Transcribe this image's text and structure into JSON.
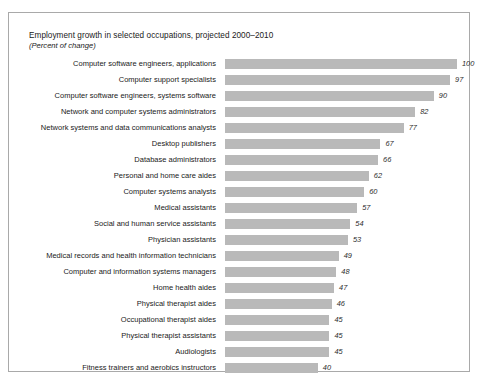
{
  "chart_data": {
    "type": "bar",
    "orientation": "horizontal",
    "title": "Employment growth in selected occupations, projected 2000–2010",
    "subtitle": "(Percent of change)",
    "xlabel": "",
    "ylabel": "",
    "xlim": [
      0,
      100
    ],
    "grid": false,
    "legend": null,
    "categories": [
      "Computer software engineers, applications",
      "Computer support specialists",
      "Computer software engineers, systems software",
      "Network and computer systems administrators",
      "Network systems and data communications analysts",
      "Desktop publishers",
      "Database administrators",
      "Personal and home care aides",
      "Computer systems analysts",
      "Medical assistants",
      "Social and human service assistants",
      "Physician assistants",
      "Medical records and health information technicians",
      "Computer and information systems managers",
      "Home health aides",
      "Physical therapist aides",
      "Occupational therapist aides",
      "Physical therapist assistants",
      "Audiologists",
      "Fitness trainers and aerobics instructors"
    ],
    "values": [
      100,
      97,
      90,
      82,
      77,
      67,
      66,
      62,
      60,
      57,
      54,
      53,
      49,
      48,
      47,
      46,
      45,
      45,
      45,
      40
    ],
    "value_labels": [
      "100",
      "97",
      "90",
      "82",
      "77",
      "67",
      "66",
      "62",
      "60",
      "57",
      "54",
      "53",
      "49",
      "48",
      "47",
      "46",
      "45",
      "45",
      "45",
      "40"
    ],
    "bar_color": "#b9b9b9",
    "frame_color": "#a9a9a9",
    "text_color": "#1a1a1a"
  }
}
